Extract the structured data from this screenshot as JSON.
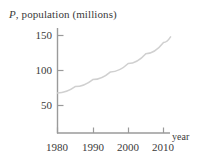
{
  "figure": {
    "width": 199,
    "height": 168,
    "background": "#ffffff",
    "axis_color": "#9a9a9a",
    "curve_color": "#d0d0d0",
    "text_color": "#3a3a3a"
  },
  "labels": {
    "y_axis_symbol": "P",
    "y_axis_rest": ", population (millions)",
    "x_axis_name": "year"
  },
  "chart_data": {
    "type": "line",
    "title": "P, population (millions)",
    "xlabel": "year",
    "ylabel": "P, population (millions)",
    "grid": false,
    "legend": null,
    "xlim": [
      1980,
      2018
    ],
    "ylim": [
      0,
      160
    ],
    "xticks": [
      1980,
      1990,
      2000,
      2010
    ],
    "xtick_labels": [
      "1980",
      "1990",
      "2000",
      "2010"
    ],
    "yticks": [
      50,
      100,
      150
    ],
    "ytick_labels": [
      "50",
      "100",
      "150"
    ],
    "series": [
      {
        "name": "population",
        "x": [
          1980,
          1985,
          1990,
          1995,
          2000,
          2005,
          2010,
          2012
        ],
        "values": [
          68,
          77,
          87,
          98,
          110,
          124,
          140,
          148
        ]
      }
    ]
  }
}
